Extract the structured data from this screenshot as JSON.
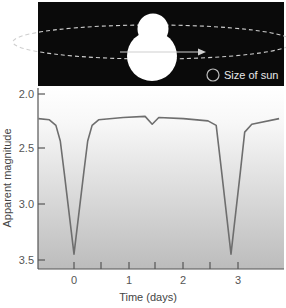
{
  "illustration": {
    "legend_label": "Size of sun",
    "background": "#0a0a0a",
    "star_color": "#ffffff",
    "orbit_color": "#cfcfcf"
  },
  "colors": {
    "curve": "#6e6e6e",
    "axis": "#555555",
    "plot_top": "#ffffff",
    "plot_bottom": "#bdbdbd"
  },
  "chart_data": {
    "type": "line",
    "title": "",
    "xlabel": "Time (days)",
    "ylabel": "Apparent magnitude",
    "xlim": [
      -0.65,
      3.8
    ],
    "ylim": [
      2.0,
      3.6
    ],
    "y_inverted": true,
    "grid": false,
    "legend": "none",
    "x_ticks": [
      0,
      0.5,
      1,
      1.5,
      2,
      2.5,
      3
    ],
    "x_tick_labels": [
      "0",
      "1",
      "2",
      "3"
    ],
    "y_ticks": [
      2.0,
      2.5,
      3.0,
      3.5
    ],
    "y_tick_labels": [
      "2.0",
      "2.5",
      "3.0",
      "3.5"
    ],
    "series": [
      {
        "name": "Algol light curve",
        "x": [
          -0.65,
          -0.45,
          -0.33,
          -0.25,
          -0.18,
          0.0,
          0.18,
          0.25,
          0.33,
          0.45,
          0.9,
          1.3,
          1.43,
          1.55,
          2.0,
          2.45,
          2.6,
          2.7,
          2.87,
          3.04,
          3.12,
          3.25,
          3.75
        ],
        "y": [
          2.22,
          2.23,
          2.28,
          2.42,
          2.7,
          3.43,
          2.7,
          2.42,
          2.28,
          2.23,
          2.21,
          2.2,
          2.27,
          2.21,
          2.22,
          2.24,
          2.28,
          2.7,
          3.43,
          2.7,
          2.34,
          2.27,
          2.22
        ]
      }
    ],
    "annotations": [
      "primary eclipse at t=0 (mag ~3.43)",
      "secondary eclipse at t~1.43 (mag ~2.27)",
      "next primary eclipse at t~2.87 (mag ~3.43)"
    ]
  }
}
